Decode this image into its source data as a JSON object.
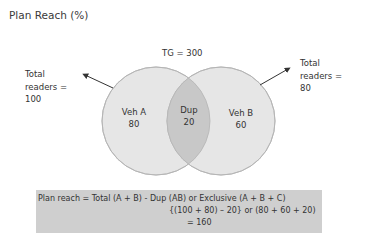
{
  "title": "Plan Reach (%)",
  "target_group": "TG = 300",
  "left_annotation": {
    "line1": "Total",
    "line2": "readers =",
    "line3": "100"
  },
  "right_annotation": {
    "line1": "Total",
    "line2": "readers =",
    "line3": "80"
  },
  "venn": {
    "set_a": {
      "label": "Veh A",
      "value": "80"
    },
    "overlap": {
      "label": "Dup",
      "value": "20"
    },
    "set_b": {
      "label": "Veh B",
      "value": "60"
    },
    "colors": {
      "circle_fill": "#e6e6e6",
      "overlap_fill": "#c8c8c8",
      "stroke": "#b5b5b5",
      "arrow": "#333333"
    }
  },
  "formula": {
    "line1": "Plan reach = Total (A + B) - Dup (AB) or Exclusive (A + B + C)",
    "line2": "{(100 + 80) – 20} or (80 + 60 + 20)",
    "line3": "= 160",
    "background": "#cfcfcf"
  }
}
